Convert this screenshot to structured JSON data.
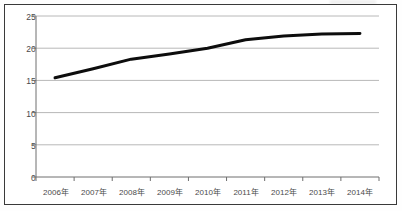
{
  "chart_data": {
    "type": "line",
    "title": "",
    "subtitle": "",
    "xlabel": "",
    "ylabel": "",
    "categories": [
      "2006年",
      "2007年",
      "2008年",
      "2009年",
      "2010年",
      "2011年",
      "2012年",
      "2013年",
      "2014年"
    ],
    "values": [
      15.4,
      16.8,
      18.3,
      19.1,
      20.0,
      21.3,
      21.9,
      22.2,
      22.3
    ],
    "series": [
      {
        "name": "",
        "values": [
          15.4,
          16.8,
          18.3,
          19.1,
          20.0,
          21.3,
          21.9,
          22.2,
          22.3
        ]
      }
    ],
    "ylim": [
      0,
      25
    ],
    "yticks": [
      0,
      5,
      10,
      15,
      20,
      25
    ],
    "ytick_labels": [
      "0",
      "5",
      "10",
      "15",
      "20",
      "25"
    ],
    "grid": true,
    "grid_axis": "y",
    "legend": false,
    "legend_position": "none",
    "line_color": "#0d0d0d",
    "line_width": 3,
    "grid_color": "#b8b8b8",
    "axis_color": "#6e6e6e",
    "frame_color": "#3a3a3a",
    "background": "#ffffff",
    "annotations": []
  },
  "axes": {
    "y_labels": [
      "25",
      "20",
      "15",
      "10",
      "5",
      "0"
    ],
    "x_labels": [
      "2006年",
      "2007年",
      "2008年",
      "2009年",
      "2010年",
      "2011年",
      "2012年",
      "2013年",
      "2014年"
    ]
  }
}
